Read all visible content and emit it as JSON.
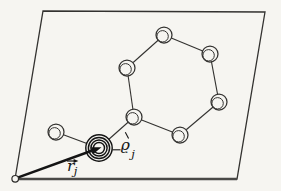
{
  "colors": {
    "paper": "#f6f5f1",
    "line": "#333230",
    "heavy": "#141414",
    "bottom_edge": "#4a4947",
    "origin_stroke": "#2b2a28"
  },
  "labels": {
    "r_symbol": "r",
    "r_subscript": "j",
    "rho_symbol": "ϱ",
    "rho_subscript": "j"
  },
  "diagram": {
    "cell_corners": [
      [
        43,
        11
      ],
      [
        265,
        12
      ],
      [
        237,
        179
      ],
      [
        15,
        179
      ]
    ],
    "origin": {
      "x": 15.2,
      "y": 178.8,
      "r": 3.3
    },
    "atoms": [
      {
        "x": 164,
        "y": 35
      },
      {
        "x": 210,
        "y": 54
      },
      {
        "x": 219,
        "y": 102
      },
      {
        "x": 180,
        "y": 135
      },
      {
        "x": 134,
        "y": 117
      },
      {
        "x": 127,
        "y": 68
      },
      {
        "x": 56,
        "y": 132
      }
    ],
    "atom_outer_r": 8,
    "atom_inner_r": 5.7,
    "atom_inner_dx": -1.4,
    "atom_inner_dy": 1.3,
    "bonds": [
      [
        0,
        1
      ],
      [
        1,
        2
      ],
      [
        2,
        3
      ],
      [
        3,
        4
      ],
      [
        4,
        5
      ],
      [
        5,
        0
      ],
      [
        4,
        "H"
      ],
      [
        "H",
        6
      ]
    ],
    "labeled_atom": {
      "x": 99,
      "y": 148,
      "radii": [
        13.2,
        10.6,
        8.1,
        5.5
      ]
    },
    "vector": {
      "x1": 15.5,
      "y1": 178.4,
      "x2": 101.5,
      "y2": 147.2,
      "width": 2.6,
      "head_len": 10,
      "head_half_w": 3.5
    },
    "leader": {
      "x1": 112.4,
      "y1": 149.8,
      "x2": 120.5,
      "y2": 149.8
    },
    "tick": {
      "x1": 125.3,
      "y1": 132.3,
      "x2": 128.6,
      "y2": 138.6
    }
  }
}
